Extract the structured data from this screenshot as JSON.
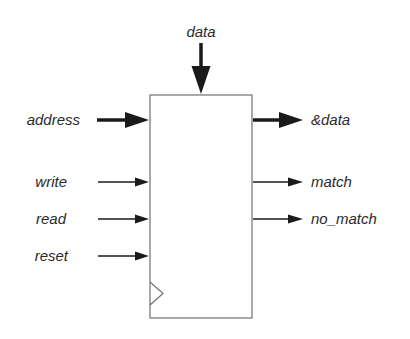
{
  "diagram": {
    "block": {
      "label": "",
      "has_clock_input": true
    },
    "top_input": {
      "label": "data",
      "bus": true
    },
    "inputs": [
      {
        "label": "address",
        "bus": true
      },
      {
        "label": "write",
        "bus": false
      },
      {
        "label": "read",
        "bus": false
      },
      {
        "label": "reset",
        "bus": false
      }
    ],
    "outputs": [
      {
        "label": "&data",
        "bus": true
      },
      {
        "label": "match",
        "bus": false
      },
      {
        "label": "no_match",
        "bus": false
      }
    ],
    "colors": {
      "stroke": "#1a1a1a",
      "box": "#707070",
      "text": "#2a2a2a"
    }
  }
}
